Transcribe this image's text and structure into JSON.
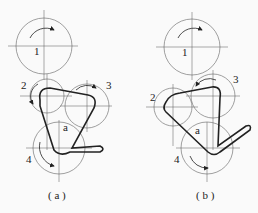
{
  "figure": {
    "panels": [
      {
        "id": "a",
        "caption": "( a )",
        "labels": {
          "gear1": "1",
          "gear2": "2",
          "gear3": "3",
          "gear4": "4",
          "region": "a"
        }
      },
      {
        "id": "b",
        "caption": "( b )",
        "labels": {
          "gear1": "1",
          "gear2": "2",
          "gear3": "3",
          "gear4": "4",
          "region": "a"
        }
      }
    ],
    "colors": {
      "line": "#222222",
      "circle": "#777777",
      "background": "#fafafa"
    }
  }
}
